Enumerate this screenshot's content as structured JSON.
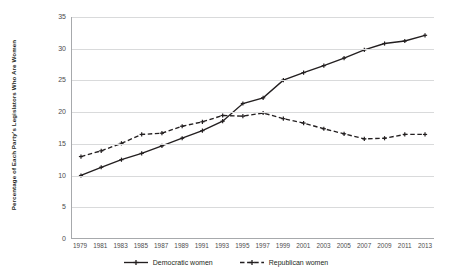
{
  "chart_data": {
    "type": "line",
    "title": "",
    "xlabel": "",
    "ylabel": "Percentage of Each Party's Legislators Who Are Women",
    "xlim": [
      1979,
      2013
    ],
    "ylim": [
      0,
      35
    ],
    "ytick_step": 5,
    "grid": true,
    "legend_position": "bottom",
    "x": [
      1979,
      1981,
      1983,
      1985,
      1987,
      1989,
      1991,
      1993,
      1995,
      1997,
      1999,
      2001,
      2003,
      2005,
      2007,
      2009,
      2011,
      2013
    ],
    "xtick_labels": [
      "1979",
      "1981",
      "1983",
      "1985",
      "1987",
      "1989",
      "1991",
      "1993",
      "1995",
      "1997",
      "1999",
      "2001",
      "2003",
      "2005",
      "2007",
      "2009",
      "2011",
      "2013"
    ],
    "ytick_labels": [
      "0",
      "5",
      "10",
      "15",
      "20",
      "25",
      "30",
      "35"
    ],
    "ytick_values": [
      0,
      5,
      10,
      15,
      20,
      25,
      30,
      35
    ],
    "series": [
      {
        "name": "Democratic women",
        "style": "solid",
        "color": "#231f20",
        "marker": "plus",
        "values": [
          9.9,
          11.2,
          12.4,
          13.4,
          14.6,
          15.8,
          17.0,
          18.5,
          21.3,
          22.2,
          25.0,
          26.2,
          27.3,
          28.5,
          29.8,
          30.8,
          31.2,
          32.1
        ]
      },
      {
        "name": "Republican women",
        "style": "dashed",
        "color": "#231f20",
        "marker": "plus",
        "values": [
          12.9,
          13.8,
          15.0,
          16.4,
          16.6,
          17.7,
          18.4,
          19.4,
          19.3,
          19.8,
          18.9,
          18.2,
          17.3,
          16.5,
          15.7,
          15.8,
          16.4,
          16.4
        ]
      }
    ]
  },
  "legend": {
    "items": [
      {
        "label": "Democratic women",
        "style": "solid"
      },
      {
        "label": "Republican women",
        "style": "dashed"
      }
    ]
  }
}
